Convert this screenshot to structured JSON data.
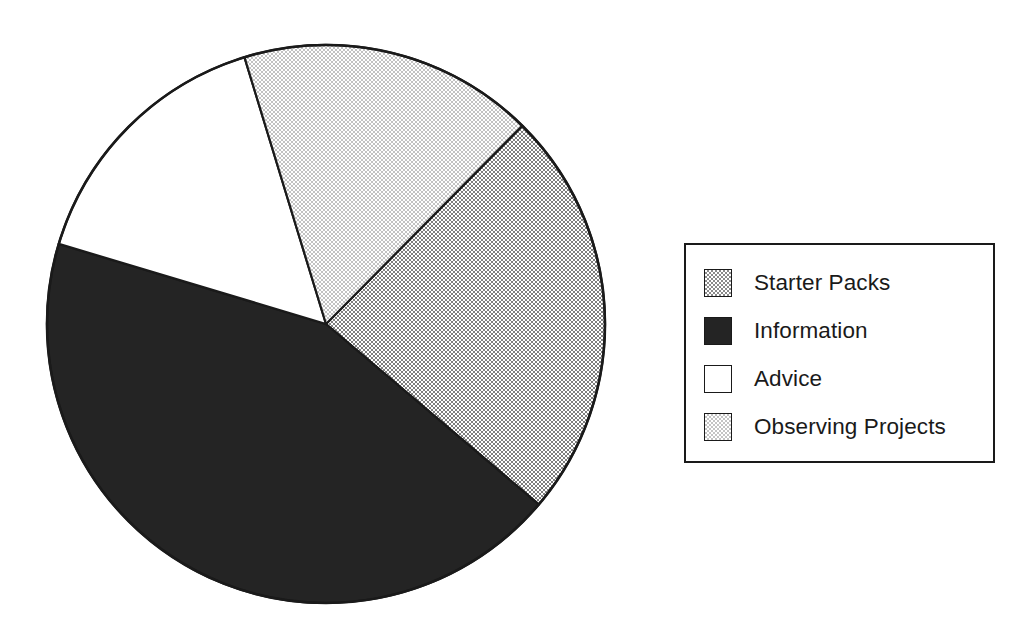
{
  "chart_data": {
    "type": "pie",
    "title": "",
    "subtitle": "",
    "xlabel": "",
    "ylabel": "",
    "grid": false,
    "legend_position": "right",
    "start_angle_deg": 343,
    "direction": "clockwise",
    "categories": [
      "Starter Packs",
      "Information",
      "Advice",
      "Observing Projects"
    ],
    "values": [
      23.8,
      43.4,
      15.6,
      17.2
    ],
    "units": "percent",
    "slices": [
      {
        "label": "Starter Packs",
        "value": 23.8,
        "angle_deg": 85.6,
        "start_angle_deg": 44.7,
        "end_angle_deg": 130.3,
        "fill_style": "dither-medium",
        "fill_color": "#8a8a8a"
      },
      {
        "label": "Information",
        "value": 43.4,
        "angle_deg": 156.4,
        "start_angle_deg": 130.3,
        "end_angle_deg": 286.7,
        "fill_style": "solid-dark",
        "fill_color": "#242424"
      },
      {
        "label": "Advice",
        "value": 15.6,
        "angle_deg": 56.3,
        "start_angle_deg": 286.7,
        "end_angle_deg": 343.0,
        "fill_style": "white",
        "fill_color": "#ffffff"
      },
      {
        "label": "Observing Projects",
        "value": 17.2,
        "angle_deg": 61.7,
        "start_angle_deg": 343.0,
        "end_angle_deg": 44.7,
        "fill_style": "dither-light",
        "fill_color": "#c4c4c4"
      }
    ]
  },
  "legend": {
    "items": [
      {
        "label": "Starter Packs",
        "swatch": "dither-medium"
      },
      {
        "label": "Information",
        "swatch": "solid-dark"
      },
      {
        "label": "Advice",
        "swatch": "white"
      },
      {
        "label": "Observing Projects",
        "swatch": "dither-light"
      }
    ]
  },
  "colors": {
    "outline": "#1a1a1a",
    "background": "#ffffff",
    "dither_medium": "#8a8a8a",
    "dither_light": "#c4c4c4",
    "solid_dark": "#242424"
  }
}
